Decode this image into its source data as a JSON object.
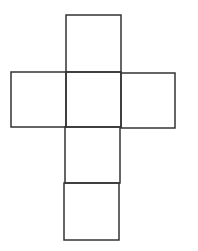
{
  "diagram": {
    "type": "cube-net",
    "stroke_color": "#333333",
    "stroke_width": 1.5,
    "background": "#ffffff",
    "squares": [
      {
        "name": "top-face",
        "x": 66,
        "y": 15,
        "w": 55,
        "h": 57
      },
      {
        "name": "left-face",
        "x": 11,
        "y": 72,
        "w": 55,
        "h": 55
      },
      {
        "name": "center-face",
        "x": 66,
        "y": 72,
        "w": 55,
        "h": 55
      },
      {
        "name": "right-face",
        "x": 121,
        "y": 73,
        "w": 54,
        "h": 55
      },
      {
        "name": "lower-face",
        "x": 65,
        "y": 127,
        "w": 55,
        "h": 56
      },
      {
        "name": "bottom-face",
        "x": 64,
        "y": 183,
        "w": 55,
        "h": 57
      }
    ]
  }
}
